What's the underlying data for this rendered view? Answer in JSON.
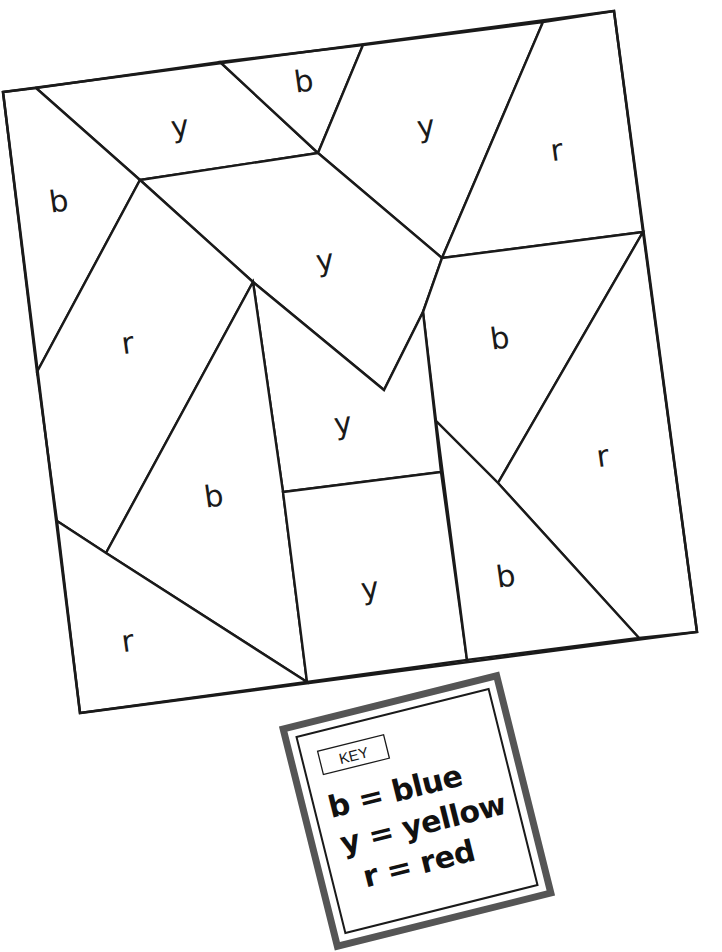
{
  "worksheet": {
    "type": "color-by-letter puzzle",
    "regions": [
      {
        "id": "top-y-left",
        "letter": "y",
        "color": "yellow"
      },
      {
        "id": "top-b-small",
        "letter": "b",
        "color": "blue"
      },
      {
        "id": "top-y-right",
        "letter": "y",
        "color": "yellow"
      },
      {
        "id": "top-r-right",
        "letter": "r",
        "color": "red"
      },
      {
        "id": "left-b",
        "letter": "b",
        "color": "blue"
      },
      {
        "id": "center-y-large",
        "letter": "y",
        "color": "yellow"
      },
      {
        "id": "left-r",
        "letter": "r",
        "color": "red"
      },
      {
        "id": "right-b",
        "letter": "b",
        "color": "blue"
      },
      {
        "id": "center-y-middle",
        "letter": "y",
        "color": "yellow"
      },
      {
        "id": "right-r",
        "letter": "r",
        "color": "red"
      },
      {
        "id": "center-b-large",
        "letter": "b",
        "color": "blue"
      },
      {
        "id": "center-y-bottom",
        "letter": "y",
        "color": "yellow"
      },
      {
        "id": "bottom-b-right",
        "letter": "b",
        "color": "blue"
      },
      {
        "id": "bottom-r-left",
        "letter": "r",
        "color": "red"
      }
    ]
  },
  "key": {
    "title": "KEY",
    "entries": [
      {
        "text": "b = blue",
        "letter": "b",
        "color_name": "blue"
      },
      {
        "text": "y = yellow",
        "letter": "y",
        "color_name": "yellow"
      },
      {
        "text": "r = red",
        "letter": "r",
        "color_name": "red"
      }
    ]
  },
  "colors": {
    "line": "#1a1a1a",
    "key_border": "#555555",
    "background": "#ffffff"
  }
}
